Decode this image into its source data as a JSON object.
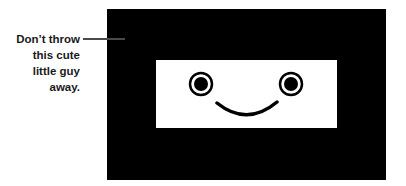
{
  "callout": {
    "lines": [
      "Don’t throw",
      "this cute",
      "little guy",
      "away."
    ]
  },
  "illustration": {
    "description": "Black rectangle containing a white screen with a smiley face",
    "colors": {
      "frame": "#000000",
      "screen": "#ffffff",
      "leader_line": "#4a4a4a"
    }
  }
}
